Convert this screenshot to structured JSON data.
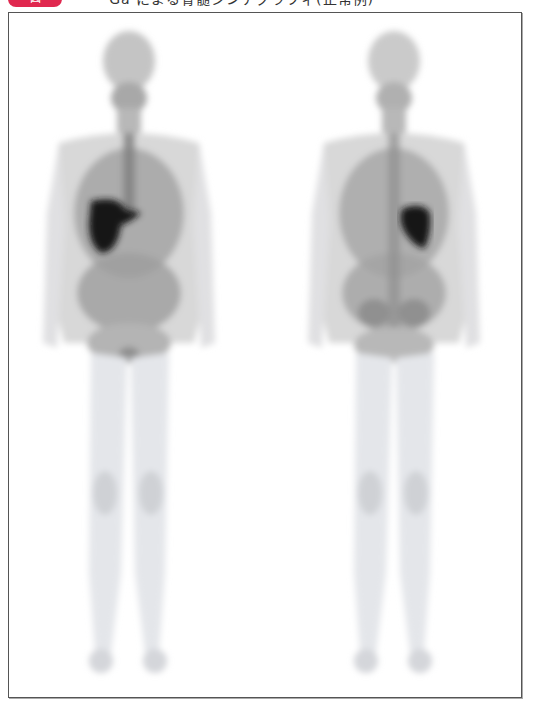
{
  "header": {
    "badge_label": "図",
    "caption": "⁶⁷Ga による骨髄シンチグラフィ(正常例)",
    "badge_color": "#e0284f"
  },
  "figure": {
    "frame_border_color": "#555555",
    "views": [
      {
        "id": "anterior",
        "label": "前面像",
        "hot_organ": "liver",
        "hot_side": "image-left"
      },
      {
        "id": "posterior",
        "label": "後面像",
        "hot_organ": "spleen",
        "hot_side": "image-right"
      }
    ],
    "tracer_color": "#1a1a1a"
  }
}
